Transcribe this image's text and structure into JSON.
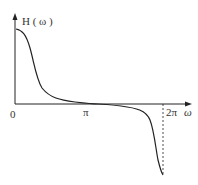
{
  "diagram": {
    "y_label": "H ( ω )",
    "x_label": "ω",
    "ticks": {
      "origin": "0",
      "pi": "π",
      "two_pi": "2π"
    },
    "curve_description": "Decreasing odd-symmetric curve about π: starts high at 0, flattens near π, drops to a negative minimum at 2π",
    "colors": {
      "stroke": "#222222",
      "background": "#ffffff"
    }
  }
}
